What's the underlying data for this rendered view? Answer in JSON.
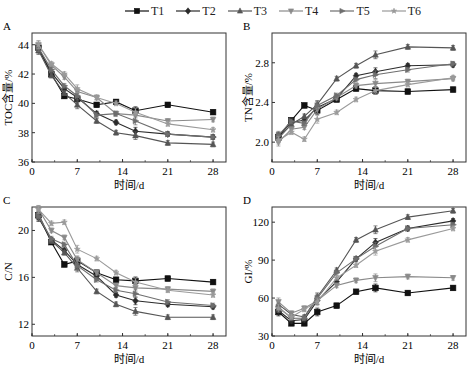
{
  "legend": [
    {
      "name": "T1",
      "marker": "square",
      "color": "#111111"
    },
    {
      "name": "T2",
      "marker": "diamond",
      "color": "#2b2b2b"
    },
    {
      "name": "T3",
      "marker": "triangle-up",
      "color": "#555555"
    },
    {
      "name": "T4",
      "marker": "triangle-down",
      "color": "#8a8a8a"
    },
    {
      "name": "T5",
      "marker": "tri-right",
      "color": "#6e6e6e"
    },
    {
      "name": "T6",
      "marker": "star",
      "color": "#9a9a9a"
    }
  ],
  "chart_data": [
    {
      "panel": "A",
      "type": "line",
      "title": "",
      "xlabel": "时间/d",
      "ylabel": "TOC含量/%",
      "xlim": [
        0,
        30
      ],
      "ylim": [
        36,
        44.8
      ],
      "xticks": [
        0,
        7,
        14,
        21,
        28
      ],
      "yticks": [
        36,
        38,
        40,
        42,
        44
      ],
      "x": [
        1,
        3,
        5,
        7,
        10,
        13,
        16,
        21,
        28
      ],
      "series": [
        {
          "name": "T1",
          "values": [
            43.8,
            42.0,
            40.5,
            40.3,
            39.9,
            40.1,
            39.5,
            39.9,
            39.4
          ]
        },
        {
          "name": "T2",
          "values": [
            43.7,
            42.1,
            41.0,
            40.4,
            39.3,
            38.7,
            38.1,
            37.9,
            37.7
          ]
        },
        {
          "name": "T3",
          "values": [
            43.6,
            41.9,
            40.7,
            39.9,
            38.8,
            38.0,
            37.8,
            37.3,
            37.2
          ]
        },
        {
          "name": "T4",
          "values": [
            44.0,
            42.6,
            41.8,
            40.8,
            40.4,
            39.3,
            39.2,
            38.8,
            38.9
          ]
        },
        {
          "name": "T5",
          "values": [
            43.8,
            42.3,
            41.2,
            40.5,
            39.2,
            39.3,
            38.8,
            37.9,
            37.7
          ]
        },
        {
          "name": "T6",
          "values": [
            44.0,
            42.7,
            42.0,
            41.0,
            40.4,
            40.0,
            39.4,
            38.6,
            38.2
          ]
        }
      ],
      "grid": false
    },
    {
      "panel": "B",
      "type": "line",
      "title": "",
      "xlabel": "时间/d",
      "ylabel": "TN含量/%",
      "xlim": [
        0,
        30
      ],
      "ylim": [
        1.8,
        3.1
      ],
      "xticks": [
        0,
        7,
        14,
        21,
        28
      ],
      "yticks": [
        2.0,
        2.4,
        2.8
      ],
      "x": [
        1,
        3,
        5,
        7,
        10,
        13,
        16,
        21,
        28
      ],
      "series": [
        {
          "name": "T1",
          "values": [
            2.05,
            2.22,
            2.37,
            2.32,
            2.43,
            2.54,
            2.52,
            2.51,
            2.53
          ]
        },
        {
          "name": "T2",
          "values": [
            2.06,
            2.2,
            2.22,
            2.35,
            2.44,
            2.67,
            2.71,
            2.77,
            2.78
          ]
        },
        {
          "name": "T3",
          "values": [
            2.04,
            2.18,
            2.26,
            2.38,
            2.64,
            2.77,
            2.88,
            2.96,
            2.95
          ]
        },
        {
          "name": "T4",
          "values": [
            2.0,
            2.13,
            2.15,
            2.33,
            2.45,
            2.57,
            2.59,
            2.61,
            2.64
          ]
        },
        {
          "name": "T5",
          "values": [
            2.07,
            2.21,
            2.19,
            2.37,
            2.47,
            2.63,
            2.68,
            2.73,
            2.79
          ]
        },
        {
          "name": "T6",
          "values": [
            2.02,
            2.1,
            2.03,
            2.23,
            2.3,
            2.43,
            2.52,
            2.58,
            2.65
          ]
        }
      ],
      "grid": false
    },
    {
      "panel": "C",
      "type": "line",
      "title": "",
      "xlabel": "时间/d",
      "ylabel": "C/N",
      "xlim": [
        0,
        30
      ],
      "ylim": [
        11,
        22
      ],
      "xticks": [
        0,
        7,
        14,
        21,
        28
      ],
      "yticks": [
        12,
        16,
        20
      ],
      "x": [
        1,
        3,
        5,
        7,
        10,
        13,
        16,
        21,
        28
      ],
      "series": [
        {
          "name": "T1",
          "values": [
            21.3,
            19.0,
            17.1,
            17.4,
            16.4,
            15.8,
            15.7,
            15.9,
            15.6
          ]
        },
        {
          "name": "T2",
          "values": [
            21.1,
            19.2,
            18.3,
            17.1,
            16.1,
            14.5,
            14.0,
            13.7,
            13.5
          ]
        },
        {
          "name": "T3",
          "values": [
            21.4,
            19.1,
            18.1,
            16.8,
            14.8,
            13.7,
            13.1,
            12.6,
            12.6
          ]
        },
        {
          "name": "T4",
          "values": [
            21.8,
            20.0,
            19.4,
            17.5,
            16.4,
            15.3,
            15.1,
            15.0,
            14.8
          ]
        },
        {
          "name": "T5",
          "values": [
            21.2,
            19.3,
            18.8,
            17.0,
            15.8,
            14.9,
            14.6,
            13.9,
            13.6
          ]
        },
        {
          "name": "T6",
          "values": [
            21.8,
            20.6,
            20.7,
            18.4,
            17.6,
            16.4,
            15.6,
            14.9,
            14.5
          ]
        }
      ],
      "grid": false
    },
    {
      "panel": "D",
      "type": "line",
      "title": "",
      "xlabel": "时间/d",
      "ylabel": "GI/%",
      "xlim": [
        0,
        30
      ],
      "ylim": [
        30,
        132
      ],
      "xticks": [
        0,
        7,
        14,
        21,
        28
      ],
      "yticks": [
        30,
        60,
        90,
        120
      ],
      "x": [
        1,
        3,
        5,
        7,
        10,
        13,
        16,
        21,
        28
      ],
      "series": [
        {
          "name": "T1",
          "values": [
            49,
            40,
            40,
            49,
            54,
            65,
            68,
            64,
            68
          ]
        },
        {
          "name": "T2",
          "values": [
            50,
            42,
            43,
            58,
            73,
            91,
            104,
            115,
            121
          ]
        },
        {
          "name": "T3",
          "values": [
            55,
            47,
            45,
            61,
            82,
            106,
            114,
            124,
            129
          ]
        },
        {
          "name": "T4",
          "values": [
            57,
            48,
            52,
            58,
            70,
            74,
            76,
            77,
            76
          ]
        },
        {
          "name": "T5",
          "values": [
            53,
            44,
            44,
            60,
            80,
            91,
            101,
            115,
            118
          ]
        },
        {
          "name": "T6",
          "values": [
            52,
            45,
            51,
            57,
            76,
            86,
            97,
            106,
            115
          ]
        }
      ],
      "grid": false
    }
  ],
  "panels": [
    {
      "label": "A",
      "xlabel": "时间/d",
      "ylabel": "TOC含量/%"
    },
    {
      "label": "B",
      "xlabel": "时间/d",
      "ylabel": "TN含量/%"
    },
    {
      "label": "C",
      "xlabel": "时间/d",
      "ylabel": "C/N"
    },
    {
      "label": "D",
      "xlabel": "时间/d",
      "ylabel": "GI/%"
    }
  ]
}
